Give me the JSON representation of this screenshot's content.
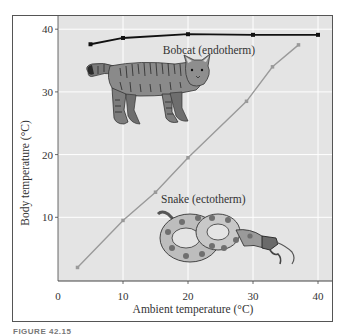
{
  "caption": "FIGURE 42.15",
  "chart_data": {
    "type": "line",
    "title": "",
    "xlabel": "Ambient temperature (°C)",
    "ylabel": "Body temperature (°C)",
    "xlim": [
      0,
      42
    ],
    "ylim": [
      0,
      42
    ],
    "xticks": [
      0,
      10,
      20,
      30,
      40
    ],
    "yticks": [
      10,
      20,
      30,
      40
    ],
    "grid": true,
    "legend": "none (inline annotations)",
    "series": [
      {
        "name": "Bobcat (endotherm)",
        "color": "#111111",
        "marker": "square",
        "x": [
          5,
          10,
          20,
          30,
          40
        ],
        "y": [
          37.6,
          38.6,
          39.2,
          39.1,
          39.1
        ]
      },
      {
        "name": "Snake (ectotherm)",
        "color": "#9a9a9a",
        "marker": "square",
        "x": [
          3,
          10,
          15,
          20,
          29,
          33,
          37
        ],
        "y": [
          2,
          9.5,
          14,
          19.5,
          28.5,
          34,
          37.5
        ]
      }
    ],
    "annotations": [
      {
        "text": "Bobcat (endotherm)",
        "x": 23,
        "y": 37.3
      },
      {
        "text": "Snake (ectotherm)",
        "x": 25,
        "y": 13
      },
      {
        "text": "bobcat illustration",
        "kind": "image"
      },
      {
        "text": "snake illustration",
        "kind": "image"
      }
    ],
    "colors": {
      "plot_background": "#e4e4e4",
      "gridline": "#ffffff",
      "frame": "#555555"
    }
  }
}
